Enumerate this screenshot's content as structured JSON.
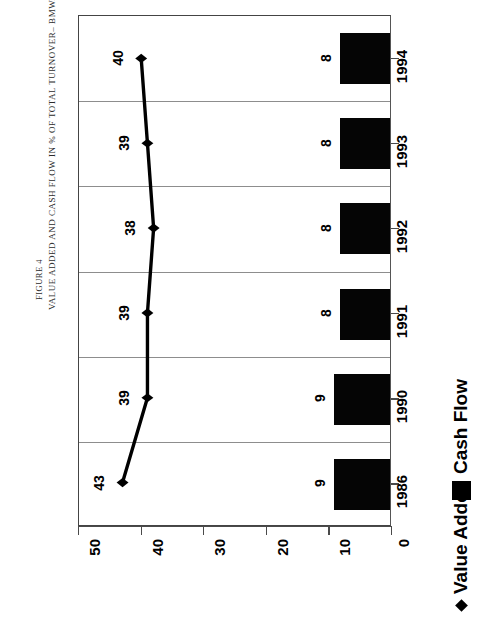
{
  "figure": {
    "number": "FIGURE 4",
    "title": "VALUE ADDED AND CASH FLOW IN % OF TOTAL TURNOVER– BMW.AG –"
  },
  "legend": {
    "value_added_label": "Value Added",
    "cash_flow_label": "Cash Flow",
    "value_added_marker": "diamond-marker-icon",
    "cash_flow_marker": "black-square-swatch-icon"
  },
  "colors": {
    "bar": "#050505",
    "line": "#000000",
    "grid": "#8d8d8d",
    "axis": "#4a4a4a",
    "background": "#ffffff"
  },
  "chart_data": {
    "type": "bar",
    "title": "VALUE ADDED AND CASH FLOW IN % OF TOTAL TURNOVER– BMW.AG –",
    "orientation": "horizontal",
    "categories": [
      "1986",
      "1990",
      "1991",
      "1992",
      "1993",
      "1994"
    ],
    "series": [
      {
        "name": "Value Added",
        "type": "line",
        "marker": "diamond",
        "values": [
          43,
          39,
          39,
          38,
          39,
          40
        ]
      },
      {
        "name": "Cash Flow",
        "type": "bar",
        "values": [
          9,
          9,
          8,
          8,
          8,
          8
        ]
      }
    ],
    "xlabel": "",
    "ylabel": "",
    "value_axis_ticks": [
      50,
      40,
      30,
      20,
      10,
      0
    ],
    "value_axis_direction": "descending-left-to-right",
    "xlim": [
      0,
      50
    ],
    "grid": true,
    "legend_position": "bottom-right",
    "rotation_deg": -90
  }
}
